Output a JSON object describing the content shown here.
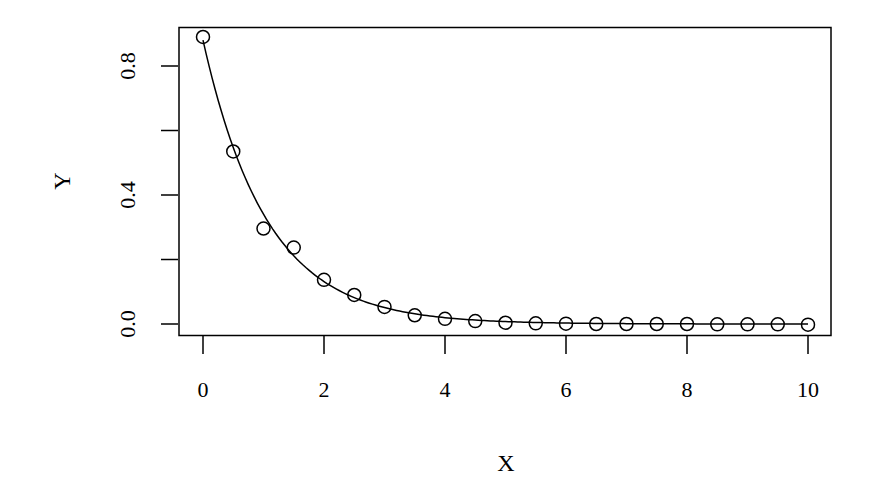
{
  "chart_data": {
    "type": "scatter",
    "title": "",
    "xlabel": "X",
    "ylabel": "Y",
    "xlim": [
      -0.4,
      10.5
    ],
    "ylim": [
      -0.04,
      0.93
    ],
    "grid": false,
    "legend": null,
    "x_ticks": [
      0,
      2,
      4,
      6,
      8,
      10
    ],
    "x_tick_labels": [
      "0",
      "2",
      "4",
      "6",
      "8",
      "10"
    ],
    "y_ticks": [
      0.0,
      0.2,
      0.4,
      0.6,
      0.8
    ],
    "y_tick_labels": [
      "0.0",
      "",
      "0.4",
      "",
      "0.8"
    ],
    "series": [
      {
        "name": "observed",
        "style": "open-circles",
        "x": [
          0,
          0.5,
          1,
          1.5,
          2,
          2.5,
          3,
          3.5,
          4,
          4.5,
          5,
          5.5,
          6,
          6.5,
          7,
          7.5,
          8,
          8.5,
          9,
          9.5,
          10
        ],
        "y": [
          0.89,
          0.535,
          0.296,
          0.237,
          0.137,
          0.09,
          0.053,
          0.027,
          0.016,
          0.009,
          0.004,
          0.002,
          0.001,
          0.0,
          0.0,
          0.0,
          0.0,
          -0.001,
          -0.001,
          -0.001,
          -0.002
        ]
      },
      {
        "name": "fitted curve",
        "style": "line",
        "function": "y = 0.88 * exp(-0.95 * x)",
        "a": 0.88,
        "k": 0.95
      }
    ]
  }
}
